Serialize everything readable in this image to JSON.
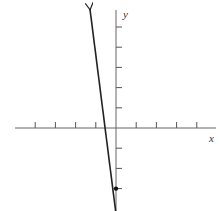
{
  "chart_data": {
    "type": "line",
    "title": "",
    "xlabel": "x",
    "ylabel": "y",
    "xlim": [
      -4,
      4
    ],
    "ylim": [
      -4,
      5
    ],
    "x_ticks": [
      -4,
      -3,
      -2,
      -1,
      1,
      2,
      3,
      4
    ],
    "y_ticks": [
      -3,
      -2,
      -1,
      1,
      2,
      3,
      4,
      5
    ],
    "tick_labels_shown": false,
    "grid": false,
    "series": [
      {
        "name": "y = -7x - 3",
        "equation": "y = -7x - 3",
        "slope": -7,
        "y_intercept": -3,
        "points": [
          [
            -1.29,
            6
          ],
          [
            0,
            -3
          ],
          [
            0.1,
            -4.05
          ]
        ],
        "arrows_both_ends": true
      }
    ],
    "marked_points": [
      {
        "x": 0,
        "y": -3,
        "label": "y-intercept"
      }
    ]
  },
  "colors": {
    "axis": "#555555",
    "line": "#222222",
    "point": "#111111"
  }
}
